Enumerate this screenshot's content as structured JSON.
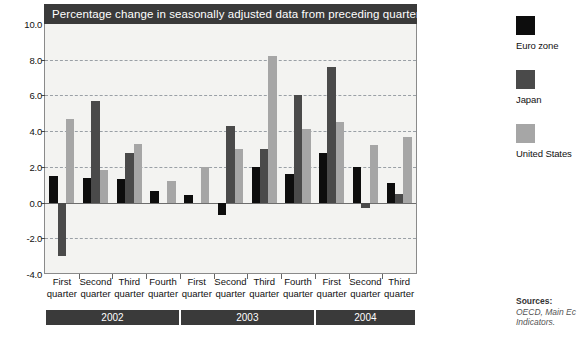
{
  "chart_data": {
    "type": "bar",
    "title": "Percentage change in seasonally adjusted data from preceding quarter",
    "xlabel": "",
    "ylabel": "",
    "ylim": [
      -4.0,
      10.0
    ],
    "yticks": [
      "-4.0",
      "-2.0",
      "0.0",
      "2.0",
      "4.0",
      "6.0",
      "8.0",
      "10.0"
    ],
    "grid": true,
    "legend_position": "right",
    "categories": [
      "First quarter",
      "Second quarter",
      "Third quarter",
      "Fourth quarter",
      "First quarter",
      "Second quarter",
      "Third quarter",
      "Fourth quarter",
      "First quarter",
      "Second quarter",
      "Third quarter"
    ],
    "category_lines": [
      [
        "First",
        "quarter"
      ],
      [
        "Second",
        "quarter"
      ],
      [
        "Third",
        "quarter"
      ],
      [
        "Fourth",
        "quarter"
      ],
      [
        "First",
        "quarter"
      ],
      [
        "Second",
        "quarter"
      ],
      [
        "Third",
        "quarter"
      ],
      [
        "Fourth",
        "quarter"
      ],
      [
        "First",
        "quarter"
      ],
      [
        "Second",
        "quarter"
      ],
      [
        "Third",
        "quarter"
      ]
    ],
    "year_groups": [
      {
        "label": "2002",
        "start_index": 0,
        "count": 4
      },
      {
        "label": "2003",
        "start_index": 4,
        "count": 4
      },
      {
        "label": "2004",
        "start_index": 8,
        "count": 3
      }
    ],
    "series": [
      {
        "name": "Euro zone",
        "color": "#0d0d0d",
        "values": [
          1.5,
          1.4,
          1.3,
          0.65,
          0.4,
          -0.7,
          2.0,
          1.6,
          2.8,
          2.0,
          1.1
        ]
      },
      {
        "name": "Japan",
        "color": "#4a4a4a",
        "values": [
          -3.0,
          5.7,
          2.8,
          0.0,
          0.0,
          4.3,
          3.0,
          6.0,
          7.6,
          -0.3,
          0.5
        ]
      },
      {
        "name": "United States",
        "color": "#a6a6a6",
        "values": [
          4.7,
          1.8,
          3.3,
          1.2,
          2.0,
          3.0,
          8.2,
          4.1,
          4.5,
          3.2,
          3.7
        ]
      }
    ]
  },
  "legend": {
    "items": [
      {
        "label": "Euro zone",
        "color": "#0d0d0d"
      },
      {
        "label": "Japan",
        "color": "#4a4a4a"
      },
      {
        "label": "United States",
        "color": "#a6a6a6"
      }
    ]
  },
  "sources": {
    "heading": "Sources:",
    "line1": "OECD, Main Ec",
    "line2": "Indicators."
  },
  "colors": {
    "title_bar_bg": "#3a3a3a",
    "title_bar_text": "#ffffff",
    "plot_bg": "#f3f3f1",
    "gridline": "#9aa0a6",
    "baseline": "#6d6d6d",
    "year_band_bg": "#3a3a3a"
  }
}
